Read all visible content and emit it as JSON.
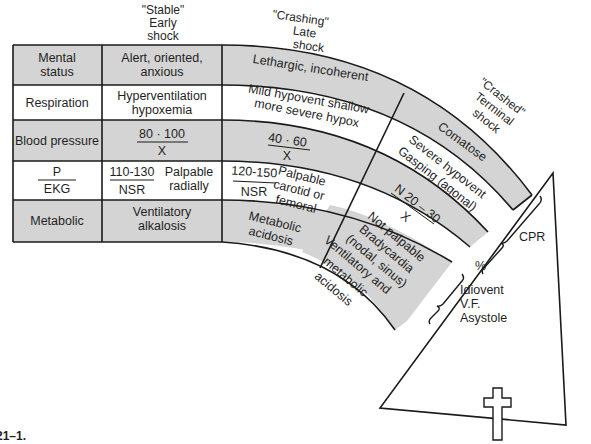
{
  "stage_headers": {
    "stable": [
      "\"Stable\"",
      "Early",
      "shock"
    ],
    "crashing": [
      "\"Crashing\"",
      "Late",
      "shock"
    ],
    "crashed": [
      "\"Crashed\"",
      "Terminal",
      "shock"
    ]
  },
  "rows": [
    {
      "label": [
        "Mental",
        "status"
      ],
      "stable": [
        "Alert, oriented,",
        "anxious"
      ],
      "crashing": [
        "Lethargic, incoherent"
      ],
      "crashed": [
        "Comatose"
      ]
    },
    {
      "label": [
        "Respiration"
      ],
      "stable": [
        "Hyperventilation",
        "hypoxemia"
      ],
      "crashing": [
        "Mild hypovent shallow",
        "more severe hypox"
      ],
      "crashed": [
        "Severe hypovent",
        "Gasping (agonal)"
      ]
    },
    {
      "label": [
        "Blood pressure"
      ],
      "stable": {
        "num": "80 · 100",
        "den": "X"
      },
      "crashing": {
        "num": "40 · 60",
        "den": "X"
      },
      "crashed": {
        "num": "N 20 – 30",
        "den": "X"
      }
    },
    {
      "label": {
        "num": "P",
        "den": "EKG"
      },
      "stable": {
        "num": "110-130",
        "den": "NSR",
        "note": [
          "Palpable",
          "radially"
        ]
      },
      "crashing": {
        "num": "120-150",
        "den": "NSR",
        "note": [
          "Palpable",
          "carotid or",
          "femoral"
        ]
      },
      "crashed": [
        "Not palpable",
        "Bradycardia",
        "(nodal, sinus)"
      ]
    },
    {
      "label": [
        "Metabolic"
      ],
      "stable": [
        "Ventilatory",
        "alkalosis"
      ],
      "crashing": [
        "Metabolic",
        "acidosis"
      ],
      "crashed": [
        "Ventilatory and",
        "metabolic",
        "acidosis"
      ]
    }
  ],
  "outcome": {
    "cpr": "CPR",
    "percent": "%",
    "rhythms": [
      "Idiovent",
      "V.F.",
      "Asystole"
    ]
  },
  "figure_label": "21–1.",
  "colors": {
    "shade": "#d4d4d4",
    "line": "#1a1a1a",
    "background": "#ffffff"
  }
}
